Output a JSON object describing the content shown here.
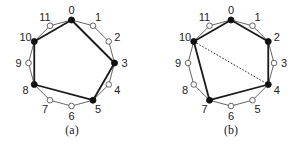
{
  "diagrams": [
    {
      "caption": "(a)",
      "node_count": 12,
      "node_labels": [
        "0",
        "1",
        "2",
        "3",
        "4",
        "5",
        "6",
        "7",
        "8",
        "9",
        "10",
        "11"
      ],
      "filled_nodes": [
        0,
        3,
        5,
        8,
        10
      ],
      "bold_edges": [
        [
          0,
          3
        ],
        [
          3,
          5
        ],
        [
          5,
          8
        ],
        [
          8,
          10
        ],
        [
          10,
          0
        ]
      ],
      "dashed_edges": []
    },
    {
      "caption": "(b)",
      "node_count": 12,
      "node_labels": [
        "0",
        "1",
        "2",
        "3",
        "4",
        "5",
        "6",
        "7",
        "8",
        "9",
        "10",
        "11"
      ],
      "filled_nodes": [
        0,
        2,
        4,
        7,
        10
      ],
      "bold_edges": [
        [
          0,
          2
        ],
        [
          2,
          4
        ],
        [
          4,
          7
        ],
        [
          7,
          10
        ],
        [
          10,
          0
        ]
      ],
      "dashed_edges": [
        [
          10,
          4
        ]
      ]
    }
  ],
  "colors": {
    "ring": "#555555",
    "bold": "#1a1a1a",
    "filled": "#111111",
    "hollow_fill": "#ffffff"
  }
}
